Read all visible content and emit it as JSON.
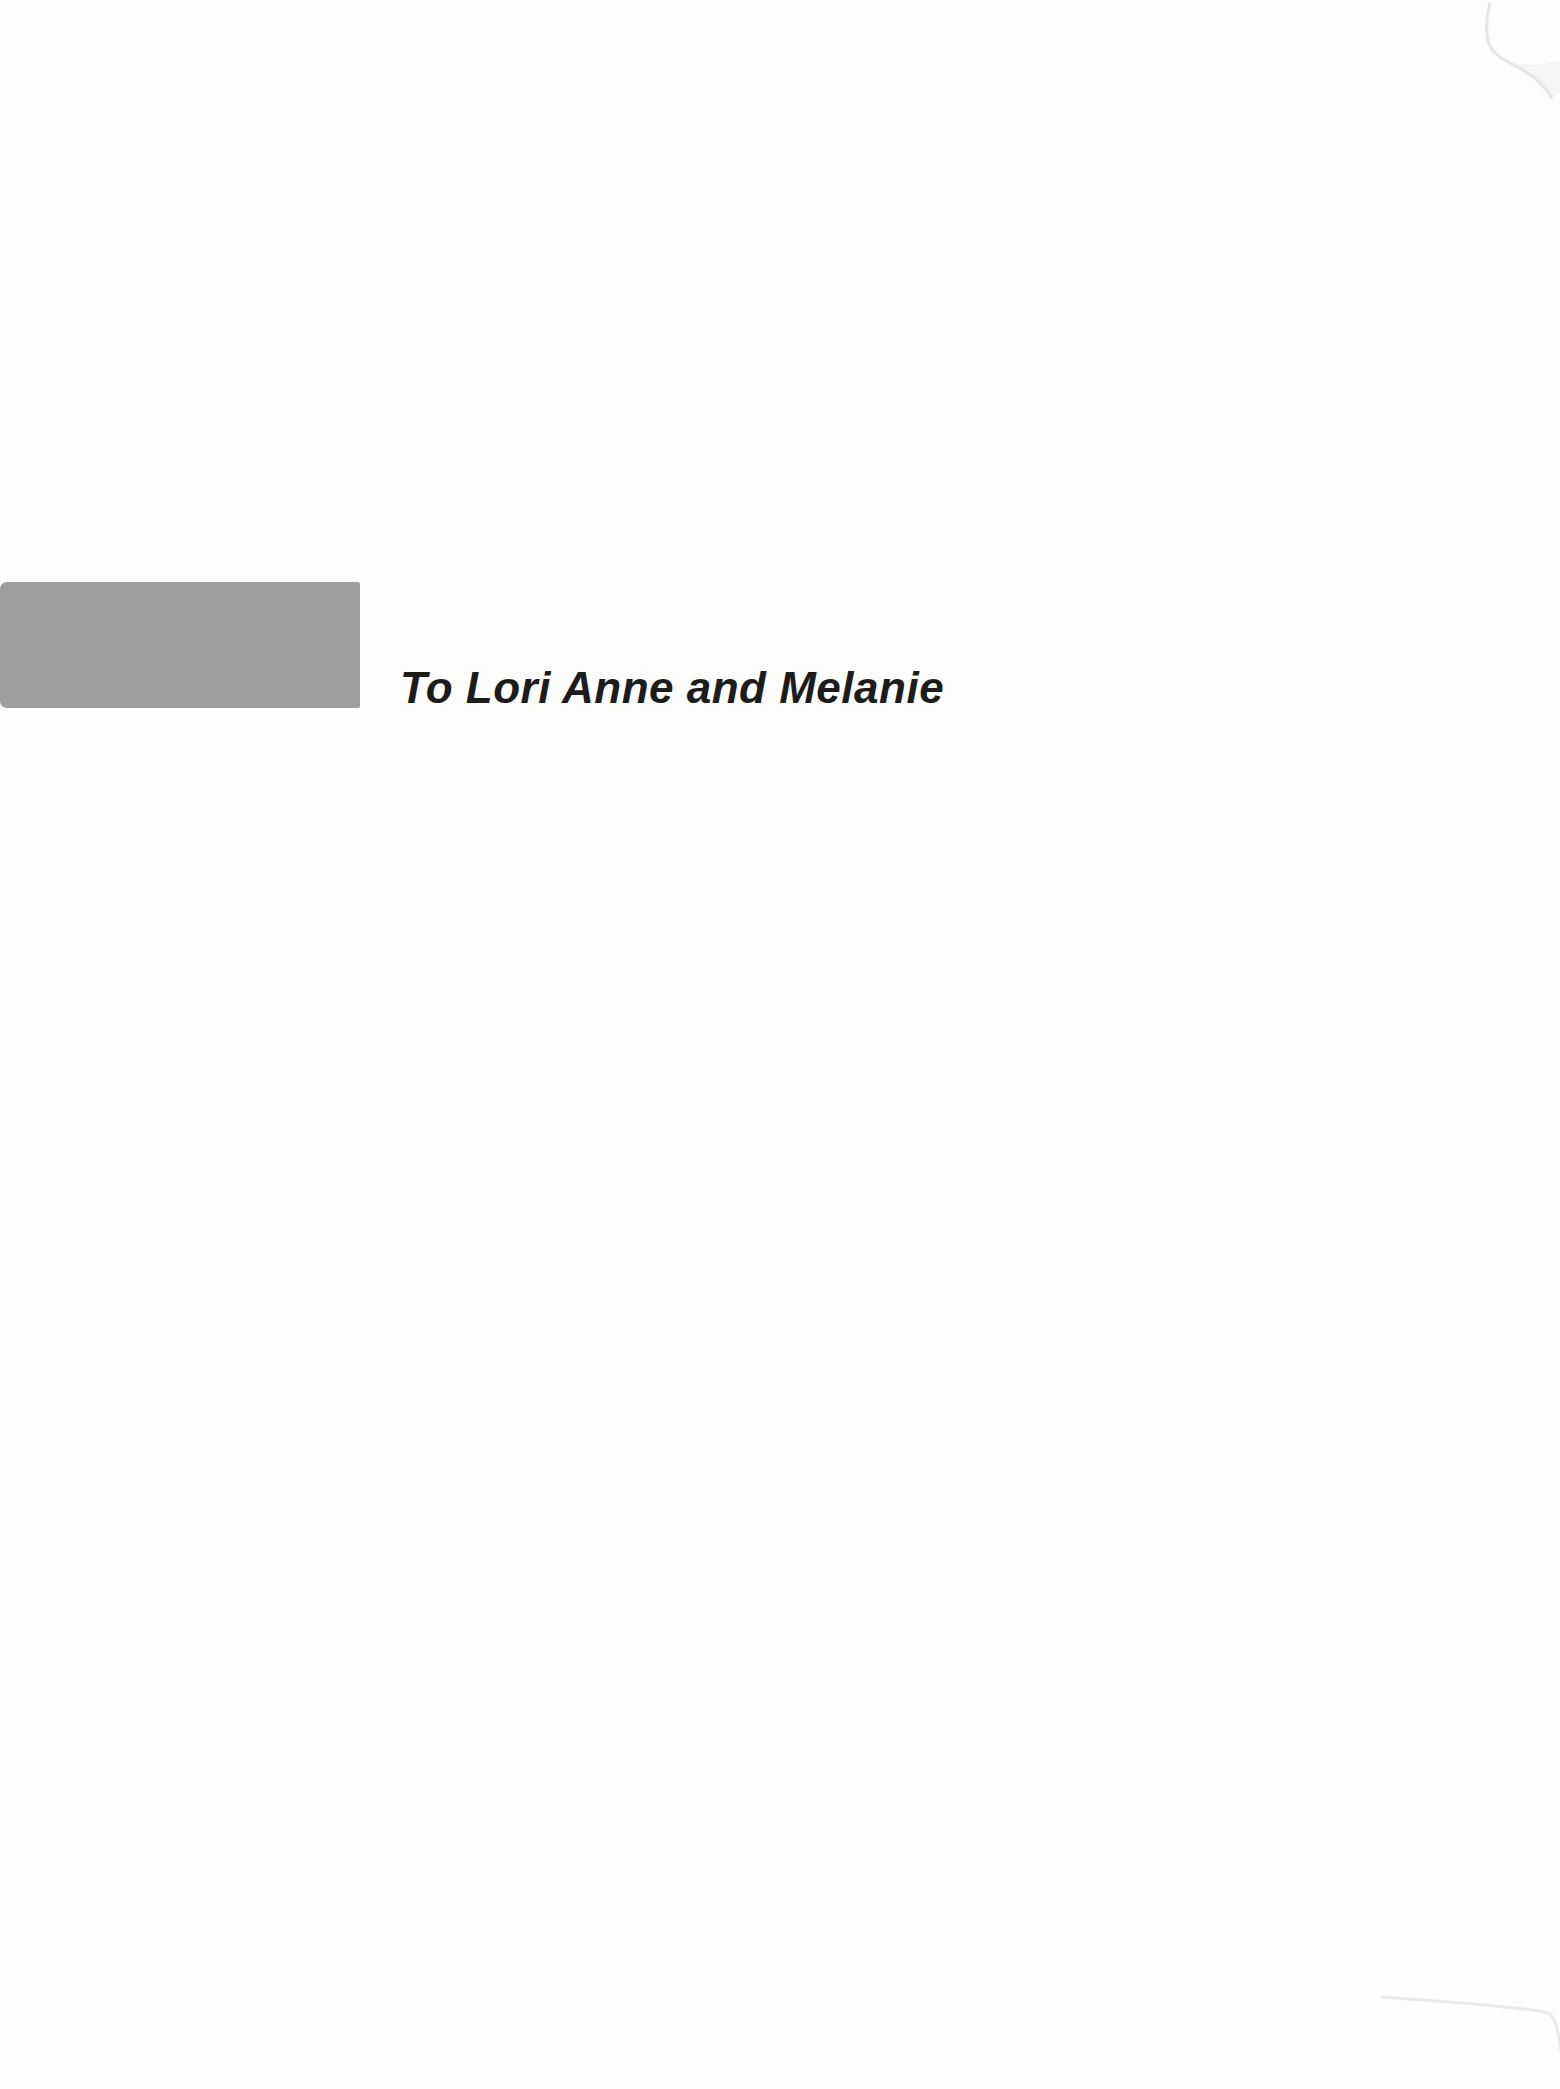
{
  "page": {
    "dedication_text": "To Lori Anne and Melanie",
    "background_color": "#fdfdfc",
    "accent_block_color": "#9d9d9d",
    "text_color": "#1c1c1c",
    "scan_artifact_color": "#d9d9d9"
  }
}
